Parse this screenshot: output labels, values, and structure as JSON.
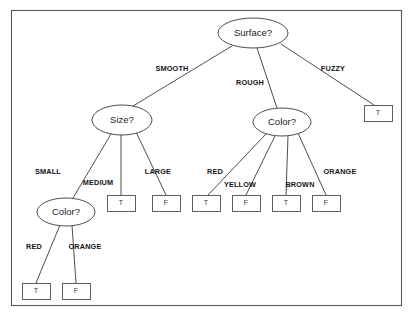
{
  "figure": {
    "background_color": "#ffffff",
    "frame_color": "#58585a",
    "line_color": "#3a3a3c",
    "text_color": "#141416"
  },
  "frame": {
    "x": 11,
    "y": 10,
    "width": 390,
    "height": 295
  },
  "chart_data": {
    "type": "diagram",
    "diagram_type": "decision-tree",
    "root": "Surface?",
    "decision_nodes": [
      {
        "id": "surface",
        "label": "Surface?",
        "cx": 253,
        "cy": 33,
        "rx": 35,
        "ry": 15
      },
      {
        "id": "size",
        "label": "Size?",
        "cx": 122,
        "cy": 120,
        "rx": 30,
        "ry": 15
      },
      {
        "id": "color_rough",
        "label": "Color?",
        "cx": 282,
        "cy": 122,
        "rx": 29,
        "ry": 14
      },
      {
        "id": "color_small",
        "label": "Color?",
        "cx": 66,
        "cy": 212,
        "rx": 29,
        "ry": 14
      }
    ],
    "leaf_nodes": [
      {
        "id": "leaf_fuzzy",
        "label": "T",
        "x": 364,
        "y": 105,
        "width": 28,
        "height": 16
      },
      {
        "id": "leaf_medium",
        "label": "T",
        "x": 107,
        "y": 195,
        "width": 28,
        "height": 16
      },
      {
        "id": "leaf_large",
        "label": "F",
        "x": 152,
        "y": 195,
        "width": 28,
        "height": 16
      },
      {
        "id": "leaf_red_rough",
        "label": "T",
        "x": 192,
        "y": 195,
        "width": 28,
        "height": 16
      },
      {
        "id": "leaf_yellow",
        "label": "F",
        "x": 232,
        "y": 195,
        "width": 28,
        "height": 16
      },
      {
        "id": "leaf_brown",
        "label": "T",
        "x": 272,
        "y": 195,
        "width": 28,
        "height": 16
      },
      {
        "id": "leaf_orange_rough",
        "label": "F",
        "x": 312,
        "y": 195,
        "width": 28,
        "height": 16
      },
      {
        "id": "leaf_red_small",
        "label": "T",
        "x": 22,
        "y": 283,
        "width": 28,
        "height": 16
      },
      {
        "id": "leaf_orange_small",
        "label": "F",
        "x": 62,
        "y": 283,
        "width": 28,
        "height": 16
      }
    ],
    "edges": [
      {
        "from": "surface",
        "to": "size",
        "label": "SMOOTH",
        "x1": 232,
        "y1": 46,
        "x2": 133,
        "y2": 106,
        "lx": 172,
        "ly": 69
      },
      {
        "from": "surface",
        "to": "color_rough",
        "label": "ROUGH",
        "x1": 257,
        "y1": 48,
        "x2": 277,
        "y2": 108,
        "lx": 250,
        "ly": 83
      },
      {
        "from": "surface",
        "to": "leaf_fuzzy",
        "label": "FUZZY",
        "x1": 281,
        "y1": 44,
        "x2": 374,
        "y2": 105,
        "lx": 333,
        "ly": 69
      },
      {
        "from": "size",
        "to": "color_small",
        "label": "SMALL",
        "x1": 111,
        "y1": 134,
        "x2": 73,
        "y2": 198,
        "lx": 48,
        "ly": 172
      },
      {
        "from": "size",
        "to": "leaf_medium",
        "label": "MEDIUM",
        "x1": 121,
        "y1": 135,
        "x2": 121,
        "y2": 195,
        "lx": 98,
        "ly": 183
      },
      {
        "from": "size",
        "to": "leaf_large",
        "label": "LARGE",
        "x1": 136,
        "y1": 132,
        "x2": 166,
        "y2": 195,
        "lx": 158,
        "ly": 172
      },
      {
        "from": "color_rough",
        "to": "leaf_red_rough",
        "label": "RED",
        "x1": 266,
        "y1": 134,
        "x2": 208,
        "y2": 195,
        "lx": 215,
        "ly": 172
      },
      {
        "from": "color_rough",
        "to": "leaf_yellow",
        "label": "YELLOW",
        "x1": 275,
        "y1": 136,
        "x2": 246,
        "y2": 195,
        "lx": 240,
        "ly": 185
      },
      {
        "from": "color_rough",
        "to": "leaf_brown",
        "label": "BROWN",
        "x1": 288,
        "y1": 136,
        "x2": 286,
        "y2": 195,
        "lx": 300,
        "ly": 185
      },
      {
        "from": "color_rough",
        "to": "leaf_orange_rough",
        "label": "ORANGE",
        "x1": 298,
        "y1": 133,
        "x2": 326,
        "y2": 195,
        "lx": 340,
        "ly": 172
      },
      {
        "from": "color_small",
        "to": "leaf_red_small",
        "label": "RED",
        "x1": 60,
        "y1": 225,
        "x2": 36,
        "y2": 283,
        "lx": 34,
        "ly": 247
      },
      {
        "from": "color_small",
        "to": "leaf_orange_small",
        "label": "ORANGE",
        "x1": 72,
        "y1": 225,
        "x2": 76,
        "y2": 283,
        "lx": 85,
        "ly": 247
      }
    ]
  }
}
